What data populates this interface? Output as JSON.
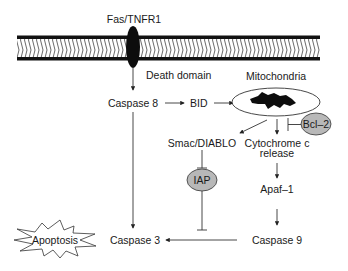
{
  "diagram": {
    "type": "signaling-pathway",
    "membrane": {
      "label": "cell membrane"
    },
    "receptor": {
      "label": "Fas/TNFR1",
      "domain_label": "Death domain"
    },
    "nodes": {
      "caspase8": "Caspase 8",
      "bid": "BID",
      "mitochondria": "Mitochondria",
      "bcl2": "Bcl–2",
      "smac": "Smac/DIABLO",
      "cytochrome_line1": "Cytochrome c",
      "cytochrome_line2": "release",
      "iap": "IAP",
      "apaf1": "Apaf–1",
      "caspase9": "Caspase 9",
      "caspase3": "Caspase 3",
      "apoptosis": "Apoptosis"
    },
    "edges": [
      {
        "from": "Fas/TNFR1",
        "to": "Caspase 8",
        "type": "activation"
      },
      {
        "from": "Caspase 8",
        "to": "BID",
        "type": "activation"
      },
      {
        "from": "BID",
        "to": "Mitochondria",
        "type": "activation"
      },
      {
        "from": "Mitochondria",
        "to": "Smac/DIABLO",
        "type": "activation"
      },
      {
        "from": "Mitochondria",
        "to": "Cytochrome c release",
        "type": "activation"
      },
      {
        "from": "Bcl–2",
        "to": "Cytochrome c release",
        "type": "inhibition"
      },
      {
        "from": "Smac/DIABLO",
        "to": "IAP",
        "type": "inhibition"
      },
      {
        "from": "IAP",
        "to": "Caspase 9",
        "type": "inhibition"
      },
      {
        "from": "Cytochrome c release",
        "to": "Apaf–1",
        "type": "activation"
      },
      {
        "from": "Apaf–1",
        "to": "Caspase 9",
        "type": "activation"
      },
      {
        "from": "Caspase 9",
        "to": "Caspase 3",
        "type": "activation"
      },
      {
        "from": "Caspase 8",
        "to": "Caspase 3",
        "type": "activation"
      },
      {
        "from": "Caspase 3",
        "to": "Apoptosis",
        "type": "leads-to"
      }
    ],
    "colors": {
      "ink": "#1a1a1a",
      "protein_fill": "#b8b8b8",
      "membrane_fill": "#ffffff"
    }
  }
}
